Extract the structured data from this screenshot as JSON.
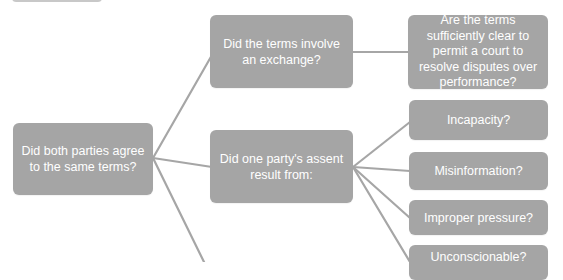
{
  "diagram": {
    "type": "tree",
    "direction": "left-to-right",
    "colors": {
      "node_fill": "#a5a5a5",
      "node_text": "#ffffff",
      "connector": "#a6a6a6",
      "background": "#ffffff"
    },
    "nodes": {
      "root": {
        "label": "Did both parties agree to the same terms?"
      },
      "exchange": {
        "label": "Did the terms involve an exchange?"
      },
      "clarity": {
        "label": "Are the terms sufficiently clear to permit a court to resolve disputes over performance?"
      },
      "assent": {
        "label": "Did one party's assent result from:"
      },
      "incapacity": {
        "label": "Incapacity?"
      },
      "misinformation": {
        "label": "Misinformation?"
      },
      "improper_pressure": {
        "label": "Improper pressure?"
      },
      "unconscionable": {
        "label": "Unconscionable?"
      }
    },
    "edges": [
      {
        "from": "root",
        "to": "exchange"
      },
      {
        "from": "root",
        "to": "assent"
      },
      {
        "from": "root",
        "to": "offscreen-below"
      },
      {
        "from": "exchange",
        "to": "clarity"
      },
      {
        "from": "assent",
        "to": "incapacity"
      },
      {
        "from": "assent",
        "to": "misinformation"
      },
      {
        "from": "assent",
        "to": "improper_pressure"
      },
      {
        "from": "assent",
        "to": "unconscionable"
      }
    ]
  }
}
